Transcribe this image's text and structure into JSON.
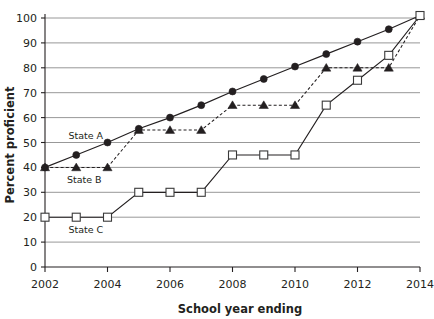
{
  "chart_data": {
    "type": "line",
    "title": "",
    "xlabel": "School year ending",
    "ylabel": "Percent proficient",
    "x": [
      2002,
      2003,
      2004,
      2005,
      2006,
      2007,
      2008,
      2009,
      2010,
      2011,
      2012,
      2013,
      2014
    ],
    "xlim": [
      2002,
      2014
    ],
    "ylim": [
      0,
      100
    ],
    "xticks": [
      2002,
      2004,
      2006,
      2008,
      2010,
      2012,
      2014
    ],
    "xticklabels": [
      "2002",
      "2004",
      "2006",
      "2008",
      "2010",
      "2012",
      "2014"
    ],
    "yticks": [
      0,
      10,
      20,
      30,
      40,
      50,
      60,
      70,
      80,
      90,
      100
    ],
    "yticklabels": [
      "0",
      "10",
      "20",
      "30",
      "40",
      "50",
      "60",
      "70",
      "80",
      "90",
      "100"
    ],
    "grid": "horizontal",
    "legend": "inline-annotations",
    "series": [
      {
        "name": "State A",
        "marker": "filled-circle",
        "linestyle": "solid",
        "color": "#231f20",
        "values": [
          40,
          45,
          50,
          55.5,
          60,
          65,
          70.5,
          75.5,
          80.5,
          85.5,
          90.5,
          95.5,
          101
        ]
      },
      {
        "name": "State B",
        "marker": "filled-triangle",
        "linestyle": "dashed",
        "color": "#231f20",
        "values": [
          40,
          40,
          40,
          55,
          55,
          55,
          65,
          65,
          65,
          80,
          80,
          80,
          101
        ]
      },
      {
        "name": "State C",
        "marker": "open-square",
        "linestyle": "solid",
        "color": "#3a3a3a",
        "values": [
          20,
          20,
          20,
          30,
          30,
          30,
          45,
          45,
          45,
          65,
          75,
          85,
          101
        ]
      }
    ],
    "annotations": [
      {
        "text": "State A",
        "x": 2002.75,
        "y": 52.5
      },
      {
        "text": "State B",
        "x": 2002.7,
        "y": 35.0
      },
      {
        "text": "State C",
        "x": 2002.75,
        "y": 15.0
      }
    ]
  }
}
